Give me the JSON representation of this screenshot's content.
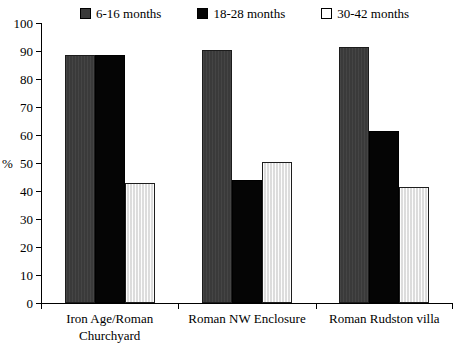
{
  "chart_data": {
    "type": "bar",
    "title": "",
    "subtitle": "",
    "xlabel": "",
    "ylabel": "%",
    "ylim": [
      0,
      100
    ],
    "ytick_step": 10,
    "yticks": [
      0,
      10,
      20,
      30,
      40,
      50,
      60,
      70,
      80,
      90,
      100
    ],
    "grid": false,
    "legend_position": "top",
    "categories": [
      "Iron Age/Roman Churchyard",
      "Roman NW Enclosure",
      "Roman Rudston villa"
    ],
    "category_lines": [
      [
        "Iron Age/Roman",
        "Churchyard"
      ],
      [
        "Roman NW Enclosure"
      ],
      [
        "Roman Rudston villa"
      ]
    ],
    "series": [
      {
        "name": "6-16 months",
        "color": "#3a3a3a",
        "values": [
          88.5,
          90.5,
          91.5
        ]
      },
      {
        "name": "18-28 months",
        "color": "#050505",
        "values": [
          88.5,
          44.0,
          61.5
        ]
      },
      {
        "name": "30-42 months",
        "color": "#efefef",
        "values": [
          43.0,
          50.5,
          41.5
        ]
      }
    ]
  },
  "legend": {
    "items": [
      {
        "label": "6-16 months",
        "swatch": "#3a3a3a"
      },
      {
        "label": "18-28 months",
        "swatch": "#050505"
      },
      {
        "label": "30-42 months",
        "swatch": "#ffffff"
      }
    ]
  },
  "axis": {
    "y_title": "%",
    "y_labels": [
      "100",
      "90",
      "80",
      "70",
      "60",
      "50",
      "40",
      "30",
      "20",
      "10",
      "0"
    ]
  }
}
